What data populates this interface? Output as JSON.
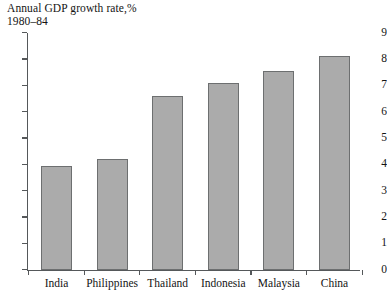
{
  "chart_data": {
    "type": "bar",
    "title": "Annual GDP growth rate,%",
    "subtitle": "1980–84",
    "xlabel": "",
    "ylabel": "",
    "categories": [
      "India",
      "Philippines",
      "Thailand",
      "Indonesia",
      "Malaysia",
      "China"
    ],
    "values": [
      3.95,
      4.2,
      6.6,
      7.1,
      7.55,
      8.1
    ],
    "ylim": [
      0,
      9
    ],
    "ytick_labels": [
      "0",
      "1",
      "2",
      "3",
      "4",
      "5",
      "6",
      "7",
      "8",
      "9"
    ],
    "ytick_values": [
      0,
      1,
      2,
      3,
      4,
      5,
      6,
      7,
      8,
      9
    ],
    "grid": false,
    "legend": false,
    "series": [
      {
        "name": "Annual GDP growth rate,%",
        "values": [
          3.95,
          4.2,
          6.6,
          7.1,
          7.55,
          8.1
        ]
      }
    ],
    "colors": {
      "bar_fill": "#ababab",
      "bar_border": "#6d6f70",
      "axis": "#55585a",
      "text": "#141414",
      "background": "#ffffff"
    }
  }
}
